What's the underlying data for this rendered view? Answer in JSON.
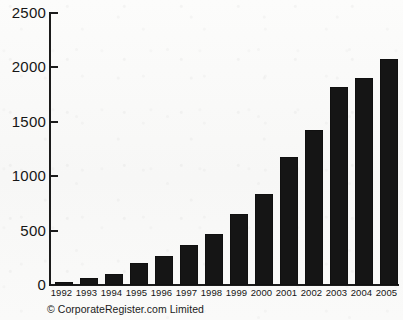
{
  "chart_data": {
    "type": "bar",
    "title": "",
    "subtitle": "",
    "xlabel": "",
    "ylabel": "",
    "categories": [
      "1992",
      "1993",
      "1994",
      "1995",
      "1996",
      "1997",
      "1998",
      "1999",
      "2000",
      "2001",
      "2002",
      "2003",
      "2004",
      "2005"
    ],
    "values": [
      28,
      64,
      101,
      202,
      267,
      368,
      469,
      652,
      836,
      1177,
      1425,
      1820,
      1903,
      2077
    ],
    "series": [
      {
        "name": "Reports",
        "values": [
          28,
          64,
          101,
          202,
          267,
          368,
          469,
          652,
          836,
          1177,
          1425,
          1820,
          1903,
          2077
        ]
      }
    ],
    "ylim": [
      0,
      2500
    ],
    "yticks": [
      0,
      500,
      1000,
      1500,
      2000,
      2500
    ],
    "ytick_labels": [
      "0",
      "500",
      "1000",
      "1500",
      "2000",
      "2500"
    ],
    "grid": false,
    "legend": false,
    "legend_position": "none",
    "bar_color": "#151515",
    "axis_color": "#1b1b1b",
    "background_color": "#fbfbfa"
  },
  "credit": {
    "text": "© CorporateRegister.com Limited"
  }
}
